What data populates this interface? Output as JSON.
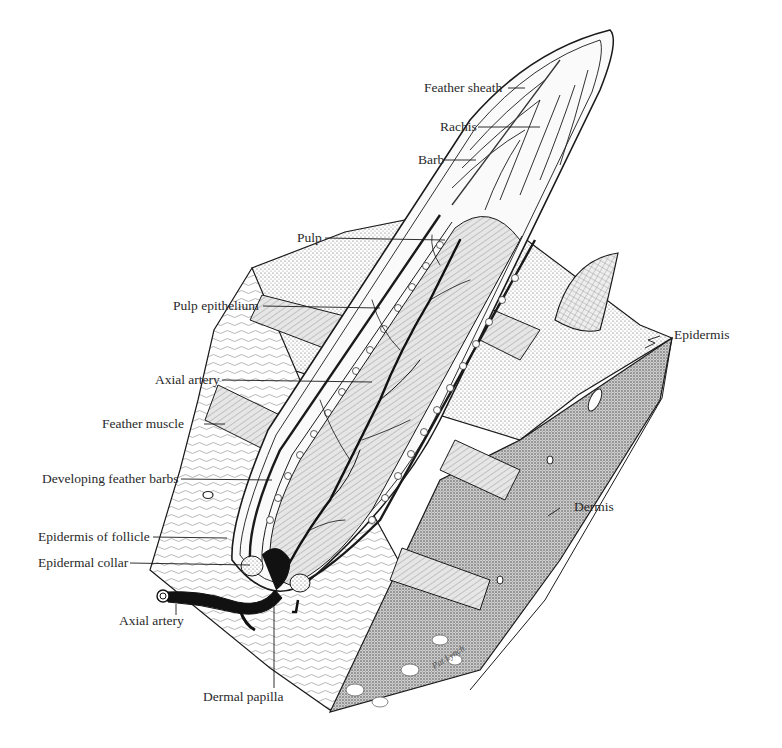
{
  "diagram": {
    "labels": {
      "feather_sheath": "Feather sheath",
      "rachis": "Rachis",
      "barb": "Barb",
      "pulp": "Pulp",
      "pulp_epithelium": "Pulp epithelium",
      "axial_artery_upper": "Axial artery",
      "feather_muscle": "Feather muscle",
      "developing_feather_barbs": "Developing feather barbs",
      "epidermis_of_follicle": "Epidermis of follicle",
      "epidermal_collar": "Epidermal collar",
      "axial_artery_lower": "Axial artery",
      "dermal_papilla": "Dermal papilla",
      "epidermis": "Epidermis",
      "dermis": "Dermis"
    },
    "signature": "Pat Lynch",
    "colors": {
      "ink": "#1a1a1a",
      "label_text": "#2a2a2a",
      "background": "#ffffff",
      "pulp_fill": "#d9d9d9",
      "dermis_fill": "#bdbdbd",
      "artery": "#111111"
    }
  }
}
